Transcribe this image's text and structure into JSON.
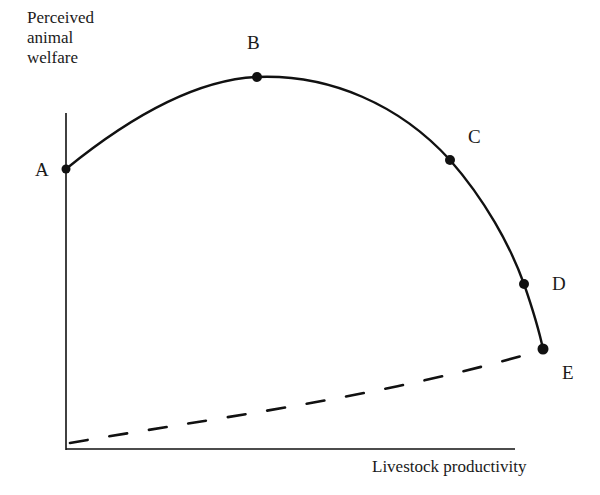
{
  "diagram": {
    "y_axis_label_lines": [
      "Perceived",
      "animal",
      "welfare"
    ],
    "x_axis_label": "Livestock productivity",
    "points": [
      {
        "id": "A",
        "label": "A",
        "x": 66,
        "y": 169
      },
      {
        "id": "B",
        "label": "B",
        "x": 257,
        "y": 77
      },
      {
        "id": "C",
        "label": "C",
        "x": 450,
        "y": 160
      },
      {
        "id": "D",
        "label": "D",
        "x": 524,
        "y": 284
      },
      {
        "id": "E",
        "label": "E",
        "x": 543,
        "y": 349
      }
    ],
    "curves": {
      "solid": "Perceived welfare curve through A, B, C, D, E (rises to peak at B then declines)",
      "dashed": "Rising dashed line from origin region toward E"
    },
    "colors": {
      "ink": "#111111",
      "background": "#ffffff"
    }
  }
}
